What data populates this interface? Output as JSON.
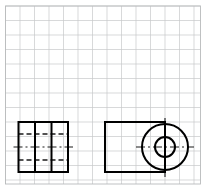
{
  "sheet": {
    "width": 207,
    "height": 190,
    "background_color": "#ffffff",
    "title": "Orthographic Projection Sketch"
  },
  "grid": {
    "type": "square-grid-paper",
    "cell_size": 14.5,
    "origin_x": 5.5,
    "origin_y": 6.0,
    "columns": 13,
    "rows": 12,
    "line_color": "#c7c9ca",
    "line_width": 0.7,
    "border_color": "#b9bbbc",
    "border_width": 0.9,
    "border_x": 5.5,
    "border_y": 6.0,
    "border_width_px": 195,
    "border_height_px": 178
  },
  "styles": {
    "visible_edge_color": "#000000",
    "visible_edge_width": 2.0,
    "hidden_edge_color": "#1a1a1a",
    "hidden_edge_width": 1.4,
    "hidden_dash": "5,3",
    "center_line_color": "#1a1a1a",
    "center_line_width": 1.1,
    "center_dash": "9,3,2,3"
  },
  "views": [
    {
      "id": "side-view",
      "name": "Left Side View",
      "outline": {
        "x": 18.5,
        "y": 122.0,
        "width": 49.5,
        "height": 50.0
      },
      "vertical_solid_lines": [
        {
          "x": 35.0,
          "y1": 122.0,
          "y2": 172.0
        },
        {
          "x": 51.5,
          "y1": 122.0,
          "y2": 172.0
        }
      ],
      "hidden_horizontal_lines": [
        {
          "y": 134.0,
          "x1": 18.5,
          "x2": 68.0
        },
        {
          "y": 160.0,
          "x1": 18.5,
          "x2": 68.0
        }
      ],
      "center_horizontal_lines": [
        {
          "y": 147.0,
          "x1": 13.5,
          "x2": 73.0
        }
      ]
    },
    {
      "id": "front-view",
      "name": "Front View",
      "outline": {
        "x": 105.0,
        "y": 122.0,
        "width": 60.0,
        "height": 50.0
      },
      "circles": [
        {
          "id": "outer-circle",
          "cx": 165.0,
          "cy": 147.0,
          "r": 23.0
        },
        {
          "id": "inner-circle",
          "cx": 165.0,
          "cy": 147.0,
          "r": 10.0
        }
      ],
      "center_horizontal_lines": [
        {
          "y": 147.0,
          "x1": 136.0,
          "x2": 194.0
        }
      ],
      "center_vertical_lines": [
        {
          "x": 165.0,
          "y1": 118.0,
          "y2": 177.0
        }
      ]
    }
  ]
}
